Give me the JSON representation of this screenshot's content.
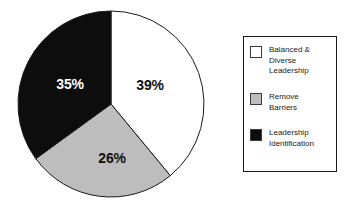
{
  "chart_data": {
    "type": "pie",
    "title": "",
    "subtitle": "",
    "xlabel": "",
    "ylabel": "",
    "grid": false,
    "legend_position": "right",
    "start_angle_deg": 0,
    "direction": "clockwise",
    "categories": [
      "Balanced & Diverse Leadership",
      "Remove Barriers",
      "Leadership Identification"
    ],
    "values": [
      39,
      26,
      35
    ],
    "value_suffix": "%",
    "data_labels": [
      "39%",
      "26%",
      "35%"
    ],
    "colors": [
      "#ffffff",
      "#bdbdbd",
      "#0d0d0d"
    ],
    "label_text_colors": [
      "#101010",
      "#101010",
      "#ffffff"
    ],
    "slice_border_color": "#1a1a1a"
  },
  "pie": {
    "slices": [
      {
        "name": "balanced-diverse-leadership",
        "label": "39%",
        "value": 39,
        "fill": "#ffffff",
        "text_tone": "on-light",
        "label_x": 150,
        "label_y": 85
      },
      {
        "name": "remove-barriers",
        "label": "26%",
        "value": 26,
        "fill": "#bdbdbd",
        "text_tone": "on-light",
        "label_x": 112,
        "label_y": 158
      },
      {
        "name": "leadership-identification",
        "label": "35%",
        "value": 35,
        "fill": "#0d0d0d",
        "text_tone": "on-dark",
        "label_x": 70,
        "label_y": 84
      }
    ],
    "center_x": 111,
    "center_y": 104,
    "radius": 93
  },
  "legend": {
    "items": [
      {
        "swatch_color": "#ffffff",
        "lines": [
          "Balanced &",
          "Diverse",
          "Leadership"
        ],
        "name": "balanced-diverse-leadership"
      },
      {
        "swatch_color": "#bdbdbd",
        "lines": [
          "Remove",
          "Barriers"
        ],
        "name": "remove-barriers"
      },
      {
        "swatch_color": "#0d0d0d",
        "lines": [
          "Leadership",
          "Identification"
        ],
        "name": "leadership-identification"
      }
    ]
  }
}
